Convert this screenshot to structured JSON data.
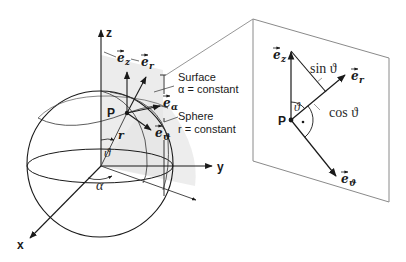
{
  "figure": {
    "colors": {
      "ink": "#1a1a1a",
      "shade": "#e9e9e9",
      "panel_border": "#8a8a8a",
      "background": "#ffffff"
    }
  },
  "sphere_view": {
    "axes": {
      "z": "z",
      "y": "y",
      "x": "x"
    },
    "point_label": "P",
    "radius_label": "r",
    "polar_angle_label": "ϑ",
    "azimuth_label": "α",
    "vectors": {
      "e_z": {
        "base": "e",
        "sub": "z"
      },
      "e_r": {
        "base": "e",
        "sub": "r"
      },
      "e_alpha": {
        "base": "e",
        "sub": "α"
      },
      "e_theta": {
        "base": "e",
        "sub": "ϑ"
      }
    },
    "annotations": {
      "surface_line1": "Surface",
      "surface_line2": "α = constant",
      "sphere_line1": "Sphere",
      "sphere_line2": "r = constant"
    }
  },
  "detail_panel": {
    "point_label": "P",
    "angle_label": "ϑ",
    "sin_label": "sin ϑ",
    "cos_label": "cos ϑ",
    "vectors": {
      "e_z": {
        "base": "e",
        "sub": "z"
      },
      "e_r": {
        "base": "e",
        "sub": "r"
      },
      "e_theta": {
        "base": "e",
        "sub": "ϑ"
      }
    },
    "right_angle_marker": "•"
  }
}
